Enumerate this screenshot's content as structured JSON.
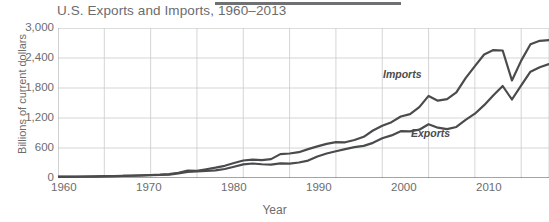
{
  "chart_data": {
    "type": "line",
    "title": "U.S. Exports and Imports, 1960–2013",
    "xlabel": "Year",
    "ylabel": "Billions of current dollars",
    "xlim": [
      1960,
      2013
    ],
    "ylim": [
      0,
      3000
    ],
    "grid": true,
    "legend_position": "inline-annotations",
    "x_ticks": [
      "1960",
      "1970",
      "1980",
      "1990",
      "2000",
      "2010"
    ],
    "x_tick_values": [
      1960,
      1970,
      1980,
      1990,
      2000,
      2010
    ],
    "y_ticks": [
      "0",
      "600",
      "1,200",
      "1,800",
      "2,400",
      "3,000"
    ],
    "y_tick_values": [
      0,
      600,
      1200,
      1800,
      2400,
      3000
    ],
    "x": [
      1960,
      1961,
      1962,
      1963,
      1964,
      1965,
      1966,
      1967,
      1968,
      1969,
      1970,
      1971,
      1972,
      1973,
      1974,
      1975,
      1976,
      1977,
      1978,
      1979,
      1980,
      1981,
      1982,
      1983,
      1984,
      1985,
      1986,
      1987,
      1988,
      1989,
      1990,
      1991,
      1992,
      1993,
      1994,
      1995,
      1996,
      1997,
      1998,
      1999,
      2000,
      2001,
      2002,
      2003,
      2004,
      2005,
      2006,
      2007,
      2008,
      2009,
      2010,
      2011,
      2012,
      2013
    ],
    "series": [
      {
        "name": "Imports",
        "color": "#4a4b4d",
        "values": [
          23,
          23,
          25,
          27,
          29,
          33,
          38,
          41,
          49,
          54,
          60,
          67,
          79,
          105,
          148,
          145,
          175,
          206,
          244,
          300,
          350,
          369,
          358,
          378,
          477,
          490,
          516,
          577,
          632,
          683,
          717,
          714,
          760,
          824,
          950,
          1043,
          1117,
          1230,
          1277,
          1418,
          1642,
          1546,
          1578,
          1711,
          1997,
          2238,
          2471,
          2559,
          2550,
          1950,
          2348,
          2675,
          2744,
          2756
        ]
      },
      {
        "name": "Exports",
        "color": "#4a4b4d",
        "values": [
          26,
          27,
          28,
          30,
          34,
          36,
          39,
          41,
          45,
          50,
          57,
          60,
          67,
          92,
          123,
          133,
          143,
          153,
          180,
          224,
          272,
          290,
          275,
          267,
          291,
          289,
          310,
          349,
          431,
          489,
          536,
          578,
          617,
          643,
          703,
          795,
          852,
          936,
          933,
          966,
          1075,
          1006,
          977,
          1021,
          1161,
          1286,
          1457,
          1653,
          1840,
          1570,
          1853,
          2127,
          2216,
          2280
        ]
      }
    ]
  },
  "figure": {
    "top_rule": "decorative-rule"
  }
}
